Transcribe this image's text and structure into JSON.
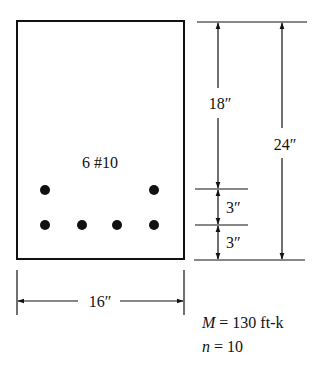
{
  "diagram": {
    "type": "reinforced-concrete-beam-cross-section",
    "reinforcement_label": "6 #10",
    "dimensions": {
      "width": "16″",
      "total_height": "24″",
      "top_to_upper_layer": "18″",
      "layer_spacing": "3″",
      "bottom_cover": "3″"
    },
    "bars": {
      "top_row_count": 2,
      "bottom_row_count": 4
    },
    "parameters": {
      "moment_symbol": "M",
      "moment_value": " = 130 ft-k",
      "n_symbol": "n",
      "n_value": " = 10"
    }
  }
}
